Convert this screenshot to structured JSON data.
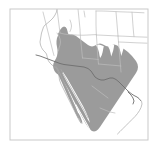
{
  "figure": {
    "kind": "range-distribution-map",
    "title": "",
    "width": 158,
    "height": 149,
    "background_color": "#ffffff"
  },
  "frame": {
    "name": "map-frame",
    "x": 10,
    "y": 9,
    "width": 138,
    "height": 131,
    "stroke_color": "#c9c9c9",
    "stroke_width": 1,
    "fill_color": "#ffffff"
  },
  "legend": {
    "visible": false,
    "entries": [
      {
        "label": "Range",
        "color": "#9b9b9b"
      }
    ]
  },
  "axes": {
    "visible": false,
    "tick_labels": [],
    "xlabel": "",
    "ylabel": ""
  },
  "layers": {
    "ocean": {
      "name": "ocean",
      "color": "#ffffff",
      "visible": true
    },
    "land": {
      "name": "land",
      "color": "#ffffff",
      "visible": true
    },
    "range": {
      "name": "species-range",
      "color": "#9b9b9b",
      "opacity": 1,
      "visible": true
    },
    "boundaries": {
      "name": "administrative-boundaries",
      "color": "#bdbdbd",
      "stroke_width": 0.7,
      "visible": true
    },
    "coastline": {
      "name": "coastline",
      "color": "#a8a8a8",
      "stroke_width": 0.7,
      "visible": true
    },
    "national_border": {
      "name": "national-border",
      "color": "#6f6f6f",
      "stroke_width": 0.9,
      "visible": true
    }
  },
  "geometry": {
    "coastline_pacific": "M 57,9 L 56.5,12 L 55,15 L 53,18 L 50,21 L 47,23.5 L 45,25 L 43.5,27 L 42.5,30 L 41.5,33 L 41,36 L 40.5,39 L 40,42 L 40.5,45 L 41.5,47.5 L 43,50 L 45,52 L 46.5,54 L 47,56 L 47.5,58.5 L 48.5,61 L 50,63 L 52,65 L 54,66.5 L 56,68 L 57.5,70 L 58.5,73 L 59,76 L 59.5,80 L 61,84 L 63,88 L 65,92 L 67,96 L 69,100 L 71,104 L 73,108 L 75,112 L 77,116 L 79,120",
    "baja_peninsula": "M 55,66 L 57,68.5 L 58.5,71.5 L 59.5,75 L 60.5,79 L 62,83.5 L 64,88 L 66,92.5 L 68,97 L 70,101 L 72,105.5 L 74,110 L 76,114 L 77.5,117.5 L 78.5,120 L 80,121.5 L 80.5,119.5 L 79.5,116 L 78,112 L 76,107.5 L 74,103 L 72,98.5 L 70.5,94.5 L 69,90.5 L 67.5,86.5 L 66,82.5 L 64.5,79 L 63,76 L 62,73 L 61,70 L 59.5,67.5 L 57.5,66 Z",
    "gulf_of_california": "M 62,69 L 66,74 L 70,80 L 74,87 L 78,94 L 82,101 L 85,107 L 87,112 L 88,116 L 86,113 L 83,108 L 80,102 L 76,95 L 72,88 L 68,81 L 65,75 L 62.5,70.5 Z",
    "range_polygon_main": "M 59,33 L 61,30 L 63,28.5 L 64.5,27.5 L 66,28 L 67,30 L 67.5,32.5 L 68.5,34 L 70,34.5 L 72,34.5 L 74,35 L 76,36 L 78,37.5 L 80,39 L 82,40.5 L 84,42 L 86,43.5 L 88,45 L 90,46 L 92,46.5 L 94,46 L 96,45 L 98,44 L 100,43.5 L 102,44 L 104,45 L 106,46 L 108,46.5 L 110,46 L 112,45 L 114,44.5 L 116,45 L 118,46 L 120,47 L 122,48 L 124,49 L 126,50.5 L 128,52 L 130,54 L 132,56 L 134,58.5 L 136,61 L 137.5,64 L 138,67 L 137.5,70 L 136,73 L 134,76 L 132,79 L 130,82 L 128,85 L 126,88 L 124,91 L 122,94 L 120,97 L 118,100 L 116,103 L 114,106 L 112,109 L 110,112 L 108,115 L 106,118 L 104,121 L 102,124 L 100,127 L 98,129.5 L 96,131 L 94,131.5 L 92,131 L 90,129.5 L 88,127 L 86,124 L 84,120.5 L 82,117 L 80,113 L 78,109 L 76,105 L 74,101 L 72,97 L 70,93 L 68,89 L 66,85.5 L 64,82 L 62,79 L 60,76.5 L 58,74.5 L 56,73 L 54.5,71 L 53.5,68.5 L 53,66 L 53.5,63.5 L 54.5,61 L 56,58.5 L 57,56 L 57.5,53 L 57.5,50 L 57,47 L 56.5,44 L 56.5,41 L 57,38 L 58,35.5 Z",
    "range_notch_a": "M 96,46 L 98,49 L 99,52 L 99.5,55 L 100,57 L 101.5,55 L 102.5,52 L 103,49 L 103.5,46.5 L 101.5,45.5 L 99,45 Z",
    "range_notch_b": "M 108,46.5 L 109.5,49.5 L 110.5,53 L 111,56 L 112,53.5 L 113,50.5 L 113.5,47.5 L 114,45 L 112,44.8 L 110,45.5 Z",
    "range_notch_c": "M 118,46 L 119.5,49 L 120.5,52.5 L 121,56 L 122,53 L 123,50 L 123.5,47 L 121.5,45.5 L 119.5,45 Z",
    "range_gulf_cut": "M 64,76 L 68,82 L 72,89 L 76,96 L 80,103 L 84,110 L 87,116 L 89,121 L 86,117 L 82,110 L 78,103 L 74,96 L 70,89 L 66,82 L 63.5,77.5 Z",
    "range_baja_strip": "M 57,67 L 59,70 L 61,74 L 63,78.5 L 65,83 L 67,87.5 L 69,92 L 71,96.5 L 73,101 L 75,105.5 L 77,110 L 78.5,114 L 79.5,117.5 L 80,120 L 78,118 L 76,114 L 74,109.5 L 72,105 L 70,100.5 L 68,96 L 66,91.5 L 64,87 L 62,82.5 L 60,78 L 58.5,74 L 57.5,70.5 Z",
    "national_border_us_mx": "M 36,55 L 40,56 L 44,57.5 L 48,59 L 52,60.5 L 56,62 L 60,63.5 L 64,64.5 L 68,65 L 72,65.5 L 76,66 L 80,66.5 L 84,67 L 88,68.5 L 91,71 L 93,74 L 95,77 L 98,79 L 101,80 L 104,80 L 107,79 L 110,78 L 113,78 L 116,79.5 L 119,82 L 122,85 L 125,88 L 128,91 L 131,93.5 L 134,95.5 L 137,97 L 139,98.5 L 140.5,100.5",
    "state_lines": [
      "M 57,9 L 57.5,13 L 58,17 L 58.5,21 L 59,25 L 59.5,29 L 60,33",
      "M 60,33 L 64,34 L 68,34.5 L 72,34.8 L 76,35 L 80,35.2 L 84,35.2 L 88,35 L 92,34.8 L 96,34.6",
      "M 96,11 L 96,18 L 96,25 L 96.2,31 L 96.4,35",
      "M 96,11 L 102,11 L 108,11.2 L 114,11.5 L 120,11.8 L 126,12 L 132,12.2 L 138,12.5 L 144,12.8",
      "M 116,12 L 116.5,18 L 117,24 L 117.5,30 L 118,36 L 118.5,42",
      "M 96.4,35 L 102,35.2 L 108,35.5 L 114,35.8 L 118,36",
      "M 118,36 L 124,36.2 L 130,36.5 L 136,36.8 L 142,37 L 147,37.2",
      "M 118.5,42 L 124,42.2 L 130,42.5 L 136,42.8 L 142,43 L 147,43.2",
      "M 132,12.2 L 132.5,19 L 133,26 L 133.5,32 L 134,36.7",
      "M 78,9 L 78.5,14 L 79,19 L 79.5,24 L 80,29 L 80.2,33",
      "M 80.2,33 L 80.5,38 L 81,43 L 81.5,48 L 82,53 L 82.5,58",
      "M 96.4,35 L 96.8,41 L 97.2,47 L 97.5,53 L 98,59 L 98.5,64",
      "M 118.5,42 L 119,48 L 119.5,54 L 120,60 L 120.5,66 L 121,72",
      "M 98.5,64 L 104,64.5 L 110,65 L 116,65.5 L 121,66",
      "M 82.5,58 L 88,58.5 L 94,59 L 98.3,59.5",
      "M 43,12 L 44,16 L 45,20 L 46,24 L 47,28 L 48,32 L 49,36 L 50,40 L 51,44 L 52,48 L 53,52 L 54,55.5"
    ],
    "inland_features": [
      "M 57,33 L 59,36 L 60,39 L 60.5,42 L 60,45 L 59,48 L 58.5,51",
      "M 70,20 L 71,23 L 71.5,26 L 71,29 L 70,31.5",
      "M 84,11 L 84.5,14 L 85,17"
    ],
    "coast_mx_east": "M 140.5,100.5 L 141.5,103 L 141,106 L 139.5,109 L 137.5,112 L 135,115 L 132,118 L 129,121 L 126,124 L 123,127 L 120,130 L 117,133"
  },
  "colors": {
    "range_fill": "#9b9b9b",
    "range_fill_light": "#aeaeae",
    "boundary": "#bdbdbd",
    "coast": "#a9a9a9",
    "border_dark": "#6e6e6e",
    "frame": "#c9c9c9",
    "background": "#ffffff"
  }
}
